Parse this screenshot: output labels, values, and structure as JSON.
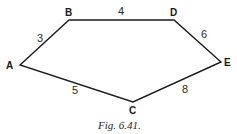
{
  "figure": {
    "caption": "Fig. 6.41.",
    "stroke_color": "#1a1a1a",
    "vertices": [
      {
        "name": "A",
        "x": 20,
        "y": 65
      },
      {
        "name": "B",
        "x": 69,
        "y": 20
      },
      {
        "name": "D",
        "x": 174,
        "y": 20
      },
      {
        "name": "E",
        "x": 221,
        "y": 62
      },
      {
        "name": "C",
        "x": 133,
        "y": 102
      }
    ],
    "vertex_labels": {
      "A": "A",
      "B": "B",
      "C": "C",
      "D": "D",
      "E": "E"
    },
    "edges": [
      {
        "from": "A",
        "to": "B",
        "weight": "3"
      },
      {
        "from": "B",
        "to": "D",
        "weight": "4"
      },
      {
        "from": "D",
        "to": "E",
        "weight": "6"
      },
      {
        "from": "E",
        "to": "C",
        "weight": "8"
      },
      {
        "from": "C",
        "to": "A",
        "weight": "5"
      }
    ],
    "edge_labels": {
      "AB": "3",
      "BD": "4",
      "DE": "6",
      "EC": "8",
      "CA": "5"
    }
  }
}
